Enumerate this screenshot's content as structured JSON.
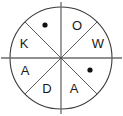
{
  "figure": {
    "background_color": "#ffffff",
    "stroke_color": "#3b3b3b",
    "divider_color": "#6b6b6b",
    "text_color": "#1a1a1a",
    "dot_color": "#111111",
    "center": {
      "x": 61,
      "y": 58
    },
    "radius": 51,
    "sector_count": 8,
    "sector_angle_degrees": 45
  },
  "sectors": [
    {
      "id": "sector-top-left",
      "position": "top-left",
      "content_type": "dot",
      "label": "",
      "label_x": 45,
      "label_y": 25
    },
    {
      "id": "sector-top-right",
      "position": "top-right",
      "content_type": "letter",
      "label": "O",
      "label_x": 77,
      "label_y": 27
    },
    {
      "id": "sector-right-upper",
      "position": "right-upper",
      "content_type": "letter",
      "label": "W",
      "label_x": 98,
      "label_y": 45
    },
    {
      "id": "sector-right-lower",
      "position": "right-lower",
      "content_type": "dot",
      "label": "",
      "label_x": 90,
      "label_y": 70
    },
    {
      "id": "sector-bottom-right",
      "position": "bottom-right",
      "content_type": "letter",
      "label": "A",
      "label_x": 74,
      "label_y": 90
    },
    {
      "id": "sector-bottom-left",
      "position": "bottom-left",
      "content_type": "letter",
      "label": "D",
      "label_x": 47,
      "label_y": 90
    },
    {
      "id": "sector-left-lower",
      "position": "left-lower",
      "content_type": "letter",
      "label": "A",
      "label_x": 25,
      "label_y": 72
    },
    {
      "id": "sector-left-upper",
      "position": "left-upper",
      "content_type": "letter",
      "label": "K",
      "label_x": 24,
      "label_y": 45
    }
  ],
  "dots": [
    {
      "id": "dot-top-left",
      "cx": 45,
      "cy": 25,
      "r": 2.6
    },
    {
      "id": "dot-right-lower",
      "cx": 90,
      "cy": 70,
      "r": 2.6
    }
  ],
  "dividers": [
    {
      "id": "divider-vertical",
      "x1": 61,
      "y1": 2,
      "x2": 61,
      "y2": 114
    },
    {
      "id": "divider-horizontal",
      "x1": 1,
      "y1": 58,
      "x2": 122,
      "y2": 58
    },
    {
      "id": "divider-diagonal-nwse",
      "x1": 25,
      "y1": 22,
      "x2": 97,
      "y2": 94
    },
    {
      "id": "divider-diagonal-nesw",
      "x1": 97,
      "y1": 22,
      "x2": 25,
      "y2": 94
    }
  ]
}
